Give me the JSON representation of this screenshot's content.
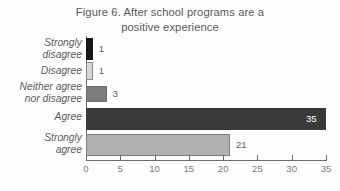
{
  "figure": {
    "title": "Figure 6. After school programs are a\npositive experience"
  },
  "chart_data": {
    "type": "bar",
    "orientation": "horizontal",
    "title": "Figure 6. After school programs are a positive experience",
    "xlabel": "",
    "ylabel": "",
    "categories": [
      "Strongly\ndisagree",
      "Disagree",
      "Neither agree\nnor disagree",
      "Agree",
      "Strongly\nagree"
    ],
    "values": [
      1,
      1,
      3,
      35,
      21
    ],
    "value_labels": [
      "1",
      "1",
      "3",
      "35",
      "21"
    ],
    "label_position": [
      "outside",
      "outside",
      "outside",
      "inside",
      "outside"
    ],
    "bar_colors": [
      "#161616",
      "#d6d6d6",
      "#7c7c7c",
      "#3a3a3c",
      "#b0b0b0"
    ],
    "bar_border_colors": [
      "#161616",
      "#8a8a8a",
      "#6a6a6a",
      "#3a3a3c",
      "#7e7e7e"
    ],
    "xlim": [
      0,
      35
    ],
    "xticks": [
      0,
      5,
      10,
      15,
      20,
      25,
      30,
      35
    ],
    "xtick_labels": [
      "0",
      "5",
      "10",
      "15",
      "20",
      "25",
      "30",
      "35"
    ],
    "grid": false,
    "legend": false
  },
  "colors": {
    "background": "#fefefe",
    "title_text": "#58585a",
    "category_text": "#5a5a5c",
    "axis": "#6d6d6f",
    "tick_text": "#7a7a7c",
    "value_text": "#5e5e60",
    "value_text_inside": "#ffffff"
  }
}
